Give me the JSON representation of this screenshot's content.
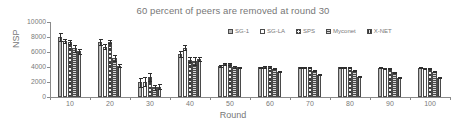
{
  "chart_data": {
    "type": "bar",
    "title": "60 percent of peers are removed at round 30",
    "xlabel": "Round",
    "ylabel": "NSP",
    "ylim": [
      0,
      10000
    ],
    "ytick_labels": [
      "10000",
      "8000",
      "6000",
      "4000",
      "2000",
      "0"
    ],
    "yticks": [
      10000,
      8000,
      6000,
      4000,
      2000,
      0
    ],
    "grid": false,
    "legend_position": "top-right-inside",
    "categories": [
      "10",
      "20",
      "30",
      "40",
      "50",
      "60",
      "70",
      "80",
      "90",
      "100"
    ],
    "series": [
      {
        "name": "SG-1",
        "values": [
          8000,
          7300,
          2000,
          5800,
          4100,
          3950,
          3950,
          3950,
          3900,
          3900
        ],
        "errors": [
          500,
          400,
          600,
          400,
          150,
          100,
          60,
          60,
          60,
          60
        ]
      },
      {
        "name": "SG-LA",
        "values": [
          7450,
          6700,
          2050,
          6600,
          4350,
          4000,
          3950,
          3950,
          3850,
          3800
        ],
        "errors": [
          300,
          350,
          600,
          350,
          120,
          80,
          60,
          60,
          60,
          60
        ]
      },
      {
        "name": "SPS",
        "values": [
          7350,
          7400,
          2650,
          5000,
          4450,
          4000,
          3900,
          3900,
          3800,
          3850
        ],
        "errors": [
          300,
          250,
          500,
          300,
          120,
          80,
          60,
          60,
          60,
          60
        ]
      },
      {
        "name": "Myconet",
        "values": [
          6500,
          5200,
          1300,
          4800,
          4000,
          3750,
          3500,
          3500,
          3300,
          3350
        ],
        "errors": [
          450,
          350,
          350,
          500,
          100,
          80,
          60,
          60,
          60,
          60
        ]
      },
      {
        "name": "X-NET",
        "values": [
          6100,
          4200,
          1400,
          5100,
          3950,
          3400,
          2950,
          2700,
          2600,
          2600
        ],
        "errors": [
          300,
          250,
          300,
          250,
          100,
          80,
          60,
          60,
          60,
          60
        ]
      }
    ]
  },
  "legend": {
    "items": [
      {
        "label": "SG-1"
      },
      {
        "label": "SG-LA"
      },
      {
        "label": "SPS"
      },
      {
        "label": "Myconet"
      },
      {
        "label": "X-NET"
      }
    ]
  },
  "colors": {
    "axis": "#8a8a8a",
    "text": "#787878",
    "bar_outline": "#4a4a4a",
    "error_bar": "#2e2e2e"
  }
}
